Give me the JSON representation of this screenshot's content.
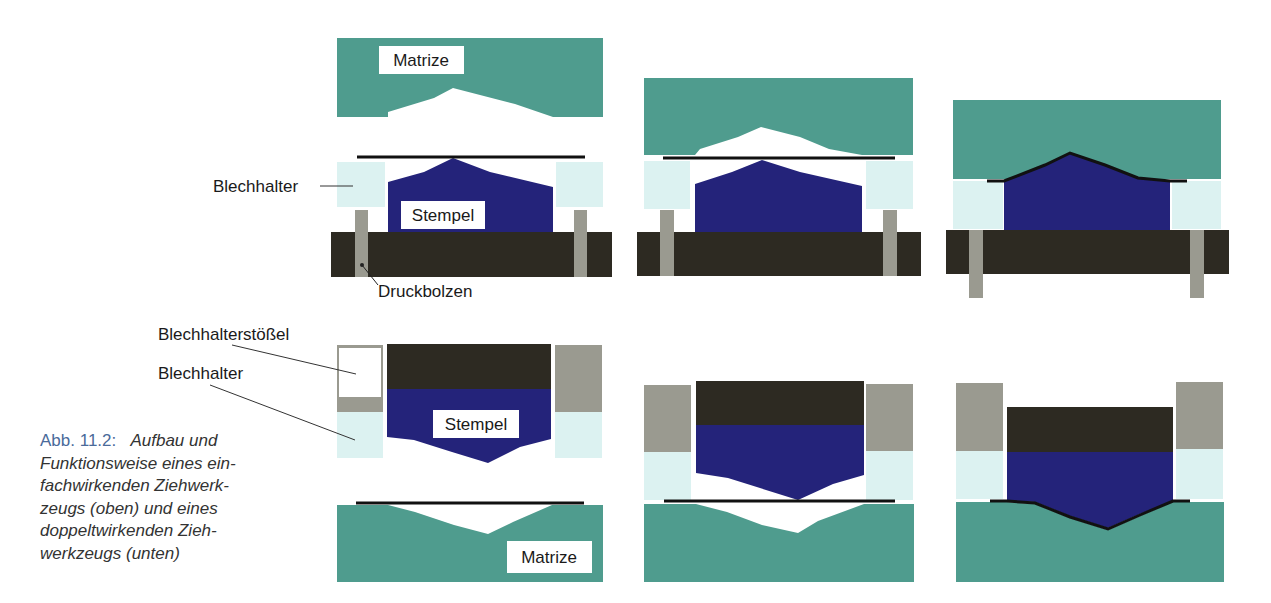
{
  "colors": {
    "matrize": "#4f9c8e",
    "stempel": "#24237a",
    "base": "#2d2a22",
    "bolt": "#9a9a90",
    "blechhalter": "#dcf2f1",
    "stoessel": "#9a9a90",
    "sheet": "#111111",
    "caption_number": "#4a6a9a",
    "caption_text": "#333333"
  },
  "labels": {
    "matrize_top": "Matrize",
    "stempel_top": "Stempel",
    "blechhalter_top": "Blechhalter",
    "druckbolzen": "Druckbolzen",
    "blechhalterstoessel": "Blechhalterstößel",
    "blechhalter_bottom": "Blechhalter",
    "stempel_bottom": "Stempel",
    "matrize_bottom": "Matrize"
  },
  "caption": {
    "number": "Abb. 11.2:",
    "lines": [
      "Aufbau und",
      "Funktionsweise eines ein-",
      "fachwirkenden Ziehwerk-",
      "zeugs (oben) und eines",
      "doppeltwirkenden Zieh-",
      "werkzeugs (unten)"
    ]
  },
  "rows": [
    {
      "name": "single-acting-drawing-tool",
      "stages": [
        "open",
        "sheet-clamped",
        "drawn"
      ]
    },
    {
      "name": "double-acting-drawing-tool",
      "stages": [
        "open",
        "sheet-clamped",
        "drawn"
      ]
    }
  ]
}
